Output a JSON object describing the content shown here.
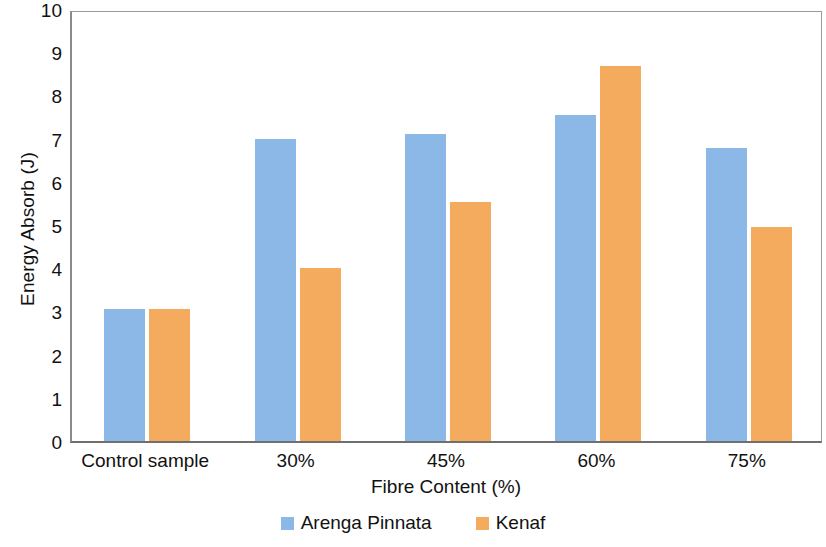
{
  "chart_data": {
    "type": "bar",
    "title": "",
    "xlabel": "Fibre Content (%)",
    "ylabel": "Energy Absorb (J)",
    "categories": [
      "Control sample",
      "30%",
      "45%",
      "60%",
      "75%"
    ],
    "series": [
      {
        "name": "Arenga Pinnata",
        "color": "#8CB8E8",
        "values": [
          3.05,
          6.98,
          7.1,
          7.55,
          6.78
        ]
      },
      {
        "name": "Kenaf",
        "color": "#F5AB5E",
        "values": [
          3.05,
          4.0,
          5.53,
          8.68,
          4.95
        ]
      }
    ],
    "ylim": [
      0,
      10
    ],
    "ytick_step": 1,
    "yticks": [
      "0",
      "1",
      "2",
      "3",
      "4",
      "5",
      "6",
      "7",
      "8",
      "9",
      "10"
    ],
    "grid": false,
    "legend_position": "bottom",
    "plot_border_color": "#8a8a8a",
    "background_color": "#ffffff"
  }
}
